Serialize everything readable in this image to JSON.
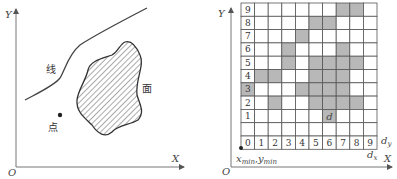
{
  "left_panel": {
    "axes": {
      "x_label": "X",
      "y_label": "Y",
      "origin_label": "O"
    },
    "labels": {
      "line": "线",
      "area": "面",
      "point": "点"
    }
  },
  "right_panel": {
    "axes": {
      "x_label": "X",
      "y_label": "Y",
      "origin_label": "O"
    },
    "grid": {
      "cols": 10,
      "rows": 10,
      "col_labels": [
        "0",
        "1",
        "2",
        "3",
        "4",
        "5",
        "6",
        "7",
        "8",
        "9"
      ],
      "row_labels": [
        "1",
        "2",
        "3",
        "4",
        "5",
        "6",
        "7",
        "8",
        "9"
      ],
      "row0_label": "0",
      "shaded_cells": [
        {
          "row": 9,
          "cols": [
            7,
            8
          ]
        },
        {
          "row": 8,
          "cols": [
            5,
            6
          ]
        },
        {
          "row": 7,
          "cols": [
            4
          ]
        },
        {
          "row": 6,
          "cols": [
            3,
            7
          ]
        },
        {
          "row": 5,
          "cols": [
            3,
            5,
            6,
            7,
            8
          ]
        },
        {
          "row": 4,
          "cols": [
            1,
            2,
            5,
            6,
            7
          ]
        },
        {
          "row": 3,
          "cols": [
            0,
            4,
            5,
            6,
            7
          ]
        },
        {
          "row": 2,
          "cols": [
            2,
            5,
            6,
            7,
            8
          ]
        },
        {
          "row": 1,
          "cols": [
            6
          ]
        }
      ],
      "cell_marker": {
        "row": 1,
        "col": 6,
        "text": "d"
      },
      "shade_color": "#b8b8b8"
    },
    "annotations": {
      "dy": "d",
      "dy_sub": "y",
      "dx": "d",
      "dx_sub": "x",
      "min_label_x": "x",
      "min_label_x_sub": "min",
      "min_label_y": "y",
      "min_label_y_sub": "min",
      "min_label_sep": ","
    }
  }
}
